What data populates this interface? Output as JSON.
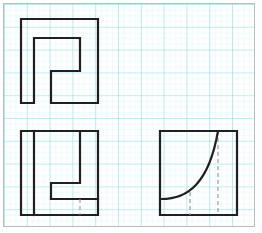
{
  "page": {
    "width": 262,
    "height": 233,
    "background_color": "#ffffff",
    "border_color": "#b9bcbd"
  },
  "grid": {
    "name": "graph-paper-grid",
    "minor_color": "#d7f2f4",
    "major_color": "#8fdde8",
    "minor_spacing_px": 5.7,
    "major_spacing_px": 22.8,
    "origin_x": 3,
    "origin_y": 3
  },
  "figures": [
    {
      "id": "top-left-spiral",
      "label": "Spiral step outline",
      "stroke_color": "#231f20",
      "stroke_width": 2.2,
      "fill": "none",
      "bounds": {
        "x": 21,
        "y": 19,
        "w": 77,
        "h": 84
      },
      "path": "M21,19 L98,19 L98,103 L51,103 L51,71 L80,71 L80,38 L34,38 L34,103 L21,103 Z"
    },
    {
      "id": "bottom-left-step-square",
      "label": "Step outline in square",
      "stroke_color": "#231f20",
      "stroke_width": 2.2,
      "fill": "none",
      "bounds": {
        "x": 21,
        "y": 131,
        "w": 77,
        "h": 84
      },
      "outer_path": "M21,131 L98,131 L98,215 L21,215 Z",
      "inner_paths": [
        "M34,131 L34,215",
        "M51,199 L51,183 L80,183 L80,131",
        "M51,199 L98,199"
      ],
      "hidden_dashes": [
        {
          "x1": 80,
          "y1": 199,
          "x2": 80,
          "y2": 215
        }
      ]
    },
    {
      "id": "bottom-right-curve-square",
      "label": "Square with concave curve",
      "stroke_color": "#231f20",
      "stroke_width": 2.2,
      "fill": "none",
      "bounds": {
        "x": 160,
        "y": 131,
        "w": 77,
        "h": 84
      },
      "outer_path": "M160,131 L237,131 L237,215 L160,215 Z",
      "curve_path": "M160,199 C 190,199 212,180 218,131",
      "hidden_dashes": [
        {
          "x1": 190,
          "y1": 192,
          "x2": 190,
          "y2": 215
        },
        {
          "x1": 218,
          "y1": 131,
          "x2": 218,
          "y2": 215
        }
      ]
    }
  ],
  "styles": {
    "hidden_dash_color": "#9a9a9a",
    "hidden_dash_width": 1.1,
    "hidden_dash_pattern": "4 3"
  }
}
